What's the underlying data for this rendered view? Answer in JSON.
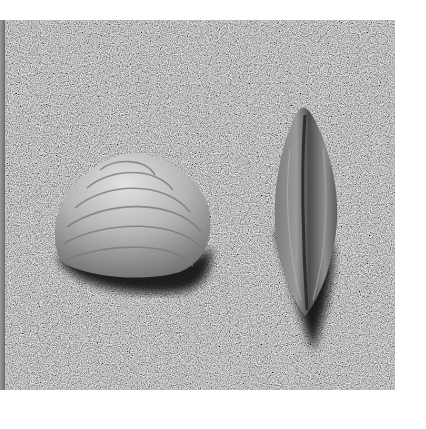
{
  "image": {
    "description": "Black-and-white photograph of two seashells resting on sand",
    "subjects": [
      {
        "name": "clam-shell",
        "shape": "rounded triangular bivalve, concentric growth rings, lying flat"
      },
      {
        "name": "mussel-shell",
        "shape": "elongated spindle-shaped shell standing on edge, casting long shadow"
      }
    ],
    "colors": {
      "background": "#ffffff",
      "sand": "#6a6a6a",
      "shell_light": "#cfcfcf",
      "shadow": "#141414"
    }
  }
}
